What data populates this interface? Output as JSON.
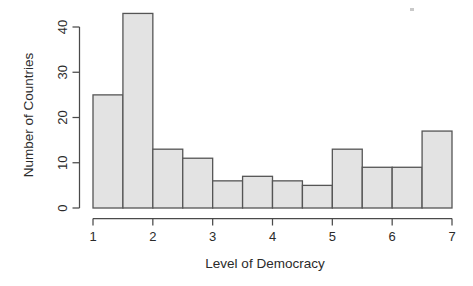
{
  "chart_data": {
    "type": "bar",
    "title": "",
    "subtitle": "",
    "xlabel": "Level of Democracy",
    "ylabel": "Number of Countries",
    "bin_width": 0.5,
    "x_bin_edges": [
      1,
      1.5,
      2,
      2.5,
      3,
      3.5,
      4,
      4.5,
      5,
      5.5,
      6,
      6.5,
      7
    ],
    "categories": [
      "1-1.5",
      "1.5-2",
      "2-2.5",
      "2.5-3",
      "3-3.5",
      "3.5-4",
      "4-4.5",
      "4.5-5",
      "5-5.5",
      "5.5-6",
      "6-6.5",
      "6.5-7"
    ],
    "values": [
      25,
      43,
      13,
      11,
      6,
      7,
      6,
      5,
      13,
      9,
      9,
      17
    ],
    "xlim": [
      1,
      7
    ],
    "ylim": [
      0,
      43
    ],
    "x_ticks": [
      1,
      2,
      3,
      4,
      5,
      6,
      7
    ],
    "x_tick_labels": [
      "1",
      "2",
      "3",
      "4",
      "5",
      "6",
      "7"
    ],
    "y_ticks": [
      0,
      10,
      20,
      30,
      40
    ],
    "y_tick_labels": [
      "0",
      "10",
      "20",
      "30",
      "40"
    ],
    "grid": false,
    "legend": "none",
    "bar_fill_color": "#e3e3e3",
    "bar_edge_color": "#555555",
    "axis_color": "#4a4a4a",
    "background_color": "#ffffff"
  }
}
